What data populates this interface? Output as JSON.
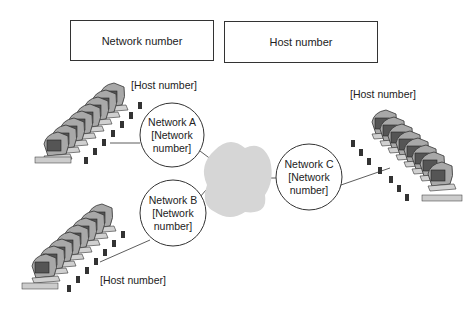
{
  "header": {
    "network_field_label": "Network number",
    "host_field_label": "Host number"
  },
  "networks": [
    {
      "name": "Network A",
      "line2": "[Network",
      "line3": "number]",
      "host_label": "[Host number]"
    },
    {
      "name": "Network B",
      "line2": "[Network",
      "line3": "number]",
      "host_label": "[Host number]"
    },
    {
      "name": "Network C",
      "line2": "[Network",
      "line3": "number]",
      "host_label": "[Host number]"
    }
  ],
  "icons": {
    "cloud": "internet-cloud-icon",
    "computers": "computer-row-icon"
  },
  "colors": {
    "cloud": "#d6d6d6",
    "outline": "#333333",
    "computer_body": "#a8a8a8"
  }
}
